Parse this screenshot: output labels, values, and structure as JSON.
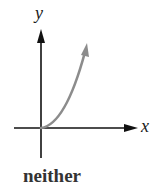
{
  "figure": {
    "x_axis_label": "x",
    "y_axis_label": "y",
    "caption": "neither"
  },
  "colors": {
    "axis": "#111111",
    "curve": "#8c8c8c",
    "caption": "#333333"
  }
}
